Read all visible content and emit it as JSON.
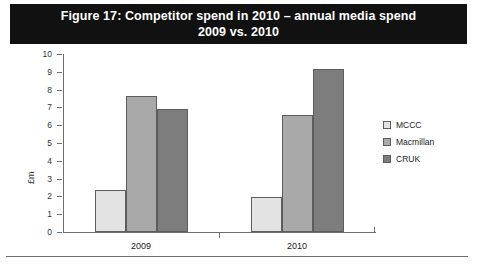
{
  "title": {
    "line1": "Figure 17: Competitor spend in 2010 – annual media spend",
    "line2": "2009 vs. 2010"
  },
  "colors": {
    "banner_bg": "#111111",
    "banner_text": "#ffffff",
    "mccc": "#e3e3e3",
    "macmillan": "#a9a9a9",
    "cruk": "#7d7d7d",
    "bar_border": "#5c5c5c",
    "axis": "#6e6e6e"
  },
  "chart_data": {
    "type": "bar",
    "title": "Figure 17: Competitor spend in 2010 – annual media spend 2009 vs. 2010",
    "xlabel": "",
    "ylabel": "£m",
    "ylim": [
      0,
      10
    ],
    "ytick_labels": [
      "0",
      "1",
      "2",
      "3",
      "4",
      "5",
      "6",
      "7",
      "8",
      "9",
      "10"
    ],
    "yticks": [
      0,
      1,
      2,
      3,
      4,
      5,
      6,
      7,
      8,
      9,
      10
    ],
    "grid": false,
    "legend_position": "right",
    "categories": [
      "2009",
      "2010"
    ],
    "series": [
      {
        "name": "MCCC",
        "color": "#e3e3e3",
        "values": [
          2.35,
          1.95
        ]
      },
      {
        "name": "Macmillan",
        "color": "#a9a9a9",
        "values": [
          7.65,
          6.6
        ]
      },
      {
        "name": "CRUK",
        "color": "#7d7d7d",
        "values": [
          6.9,
          9.15
        ]
      }
    ]
  }
}
